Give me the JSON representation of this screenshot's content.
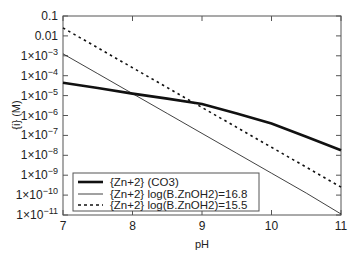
{
  "chart_data": {
    "type": "line",
    "title": "",
    "xlabel": "pH",
    "ylabel": "{i} (M)",
    "xlim": [
      7,
      11
    ],
    "ylim": [
      1e-11,
      0.1
    ],
    "yscale": "log",
    "grid": false,
    "legend_position": "lower left",
    "x_ticks": [
      {
        "value": 7,
        "label": "7"
      },
      {
        "value": 8,
        "label": "8"
      },
      {
        "value": 9,
        "label": "9"
      },
      {
        "value": 10,
        "label": "10"
      },
      {
        "value": 11,
        "label": "11"
      }
    ],
    "y_ticks": [
      {
        "log": -1,
        "base": "0.1",
        "exp": ""
      },
      {
        "log": -2,
        "base": "0.01",
        "exp": ""
      },
      {
        "log": -3,
        "base": "1×10",
        "exp": "−3"
      },
      {
        "log": -4,
        "base": "1×10",
        "exp": "−4"
      },
      {
        "log": -5,
        "base": "1×10",
        "exp": "−5"
      },
      {
        "log": -6,
        "base": "1×10",
        "exp": "−6"
      },
      {
        "log": -7,
        "base": "1×10",
        "exp": "−7"
      },
      {
        "log": -8,
        "base": "1×10",
        "exp": "−8"
      },
      {
        "log": -9,
        "base": "1×10",
        "exp": "−9"
      },
      {
        "log": -10,
        "base": "1×10",
        "exp": "−10"
      },
      {
        "log": -11,
        "base": "1×10",
        "exp": "−11"
      }
    ],
    "x": [
      7,
      7.5,
      8,
      8.5,
      9,
      9.5,
      10,
      10.5,
      11
    ],
    "series": [
      {
        "name": "{Zn+2} (CO3)",
        "style": "thick-solid",
        "log_values": [
          -4.35,
          -4.62,
          -4.9,
          -5.15,
          -5.42,
          -5.9,
          -6.4,
          -7.07,
          -7.75
        ]
      },
      {
        "name": "{Zn+2} log(B.ZnOH2)=16.8",
        "style": "thin-solid",
        "log_values": [
          -2.9,
          -3.9,
          -4.9,
          -5.9,
          -6.9,
          -7.9,
          -8.9,
          -9.9,
          -10.95
        ]
      },
      {
        "name": "{Zn+2} log(B.ZnOH2)=15.5",
        "style": "dotted",
        "log_values": [
          -1.6,
          -2.6,
          -3.6,
          -4.6,
          -5.6,
          -6.6,
          -7.6,
          -8.6,
          -9.6
        ]
      }
    ]
  },
  "legend": {
    "items": [
      {
        "label": "{Zn+2} (CO3)"
      },
      {
        "label": "{Zn+2} log(B.ZnOH2)=16.8"
      },
      {
        "label": "{Zn+2} log(B.ZnOH2)=15.5"
      }
    ]
  },
  "colors": {
    "line": "#111111",
    "axis": "#555555",
    "text": "#222222"
  }
}
